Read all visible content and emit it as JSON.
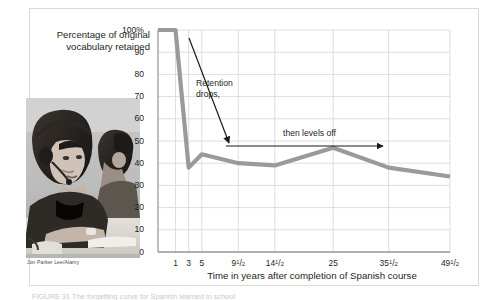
{
  "figure": {
    "y_axis_title": "Percentage of original vocabulary retained",
    "x_axis_title": "Time in years after completion of Spanish course",
    "photo_credit": "Jon Parker Lee/Alamy",
    "photo_alt": "photo-students-language-lab",
    "bottom_caption": "FIGURE 31  The forgetting curve for Spanish learned in school"
  },
  "annotations": {
    "drop_line1": "Retention",
    "drop_line2": "drops,",
    "levels_off": "then levels off"
  },
  "colors": {
    "line": "#9a9a9a",
    "grid": "#d5d5d5",
    "axis": "#9b9b9b",
    "text": "#231f20",
    "frame": "#d9d9d9",
    "arrow": "#1a1a1a"
  },
  "chart_data": {
    "type": "line",
    "title": "",
    "xlabel": "Time in years after completion of Spanish course",
    "ylabel": "Percentage of original vocabulary retained",
    "ylim": [
      0,
      100
    ],
    "ytick_values": [
      0,
      10,
      20,
      30,
      40,
      50,
      60,
      70,
      80,
      90,
      100
    ],
    "ytick_labels": [
      "0",
      "10",
      "20",
      "30",
      "40",
      "50",
      "60",
      "70",
      "80",
      "90",
      "100%"
    ],
    "xtick_labels": [
      {
        "whole": "1",
        "num": "",
        "den": ""
      },
      {
        "whole": "3",
        "num": "",
        "den": ""
      },
      {
        "whole": "5",
        "num": "",
        "den": ""
      },
      {
        "whole": "9",
        "num": "1",
        "den": "2"
      },
      {
        "whole": "14",
        "num": "1",
        "den": "2"
      },
      {
        "whole": "25",
        "num": "",
        "den": ""
      },
      {
        "whole": "35",
        "num": "1",
        "den": "2"
      },
      {
        "whole": "49",
        "num": "1",
        "den": "2"
      }
    ],
    "grid": true,
    "legend": false,
    "series": [
      {
        "name": "Percentage of original vocabulary retained",
        "x": [
          0,
          1,
          3,
          5,
          9.5,
          14.5,
          25,
          35.5,
          49.5
        ],
        "values": [
          100,
          100,
          38,
          44,
          40,
          39,
          47,
          38,
          34
        ]
      }
    ]
  }
}
